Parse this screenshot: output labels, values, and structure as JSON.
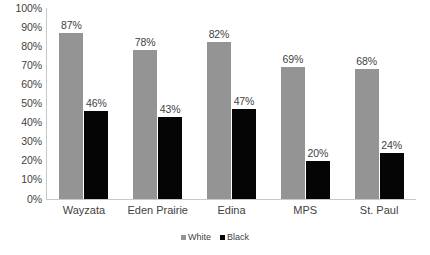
{
  "chart_data": {
    "type": "bar",
    "title": "",
    "subtitle": "",
    "xlabel": "",
    "ylabel": "",
    "ylim": [
      0,
      100
    ],
    "grid": false,
    "legend_position": "bottom",
    "categories": [
      "Wayzata",
      "Eden Prairie",
      "Edina",
      "MPS",
      "St. Paul"
    ],
    "series": [
      {
        "name": "White",
        "color": "#949494",
        "values": [
          87,
          78,
          82,
          69,
          68
        ],
        "labels": [
          "87%",
          "78%",
          "82%",
          "69%",
          "68%"
        ]
      },
      {
        "name": "Black",
        "color": "#050505",
        "values": [
          46,
          43,
          47,
          20,
          24
        ],
        "labels": [
          "46%",
          "43%",
          "47%",
          "20%",
          "24%"
        ]
      }
    ],
    "y_ticks": [
      100,
      90,
      80,
      70,
      60,
      50,
      40,
      30,
      20,
      10,
      0
    ],
    "y_tick_labels": [
      "100%",
      "90%",
      "80%",
      "70%",
      "60%",
      "50%",
      "40%",
      "30%",
      "20%",
      "10%",
      "0%"
    ]
  }
}
